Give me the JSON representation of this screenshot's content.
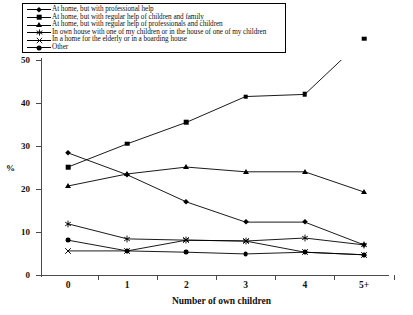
{
  "legend": {
    "position": "top-left",
    "items": [
      {
        "marker": "diamond-marker",
        "label": "At home, but with professional help"
      },
      {
        "marker": "square-marker",
        "label": "At home, but with regular help of children and family"
      },
      {
        "marker": "triangle-marker",
        "label": "At home, but with regular help of professionals and children"
      },
      {
        "marker": "star-marker",
        "label": "In own house with one of my children or in the house of one of my children"
      },
      {
        "marker": "x-marker",
        "label": "In a home for the elderly or in a boarding house"
      },
      {
        "marker": "circle-marker",
        "label": "Other"
      }
    ]
  },
  "axes": {
    "y_title": "%",
    "x_title": "Number of own children",
    "y_ticks": [
      "0",
      "10",
      "20",
      "30",
      "40",
      "50"
    ],
    "x_ticks": [
      "0",
      "1",
      "2",
      "3",
      "4",
      "5+"
    ]
  },
  "chart_data": {
    "type": "line",
    "title": "",
    "subtitle": "",
    "xlabel": "Number of own children",
    "ylabel": "%",
    "categories": [
      "0",
      "1",
      "2",
      "3",
      "4",
      "5+"
    ],
    "ylim": [
      0,
      50
    ],
    "xlim": [
      0,
      5
    ],
    "ytick_step": 10,
    "grid": false,
    "legend_position": "top-left",
    "line_color": "#000000",
    "marker_color": "#000000",
    "series": [
      {
        "name": "At home, but with professional help",
        "marker": "diamond",
        "values": [
          28.4,
          23.3,
          17.0,
          12.3,
          12.3,
          7.0
        ]
      },
      {
        "name": "At home, but with regular help of children and family",
        "marker": "square",
        "values": [
          25.1,
          30.5,
          35.5,
          41.5,
          42.0,
          55.0
        ]
      },
      {
        "name": "At home, but with regular help of professionals and children",
        "marker": "triangle",
        "values": [
          20.7,
          23.5,
          25.1,
          24.0,
          24.0,
          19.3
        ]
      },
      {
        "name": "In own house with one of my children or in the house of one of my children",
        "marker": "star",
        "values": [
          11.9,
          8.4,
          8.1,
          7.9,
          8.6,
          7.0
        ]
      },
      {
        "name": "In a home for the elderly or in a boarding house",
        "marker": "x",
        "values": [
          5.6,
          5.6,
          8.1,
          7.9,
          5.3,
          4.7
        ]
      },
      {
        "name": "Other",
        "marker": "circle",
        "values": [
          8.1,
          5.6,
          5.3,
          4.9,
          5.3,
          4.7
        ]
      }
    ]
  }
}
